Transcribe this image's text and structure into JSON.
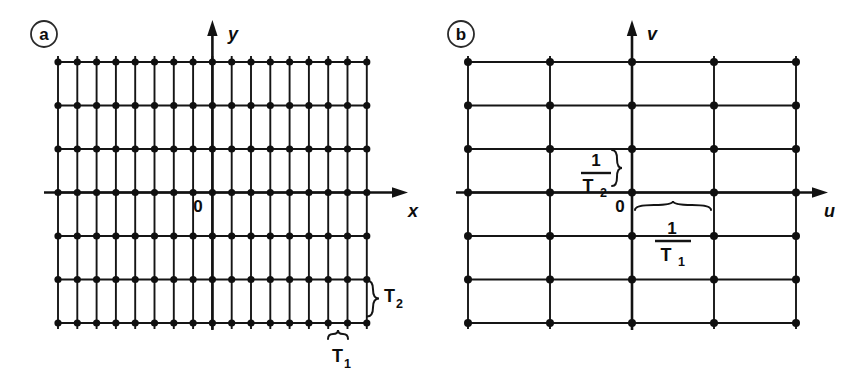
{
  "figure": {
    "background_color": "#ffffff",
    "ink_color": "#101010",
    "panels": [
      {
        "id": "a",
        "label": "a",
        "description": "direct-space sampling lattice",
        "axes": {
          "horizontal": "x",
          "vertical": "u_unused_v",
          "vertical_label": "y"
        },
        "origin_label": "0",
        "grid": {
          "columns": 17,
          "rows": 7,
          "x_start": 58,
          "x_step": 19.3,
          "y_start": 62,
          "y_step": 43.5,
          "origin_col_index": 8,
          "origin_row_index": 3
        },
        "spacing_labels": {
          "vertical": {
            "text": "T",
            "sub": "2"
          },
          "horizontal": {
            "text": "T",
            "sub": "1"
          }
        }
      },
      {
        "id": "b",
        "label": "b",
        "description": "reciprocal-space replication lattice",
        "axes": {
          "horizontal": "u",
          "vertical_label": "v"
        },
        "origin_label": "0",
        "grid": {
          "columns": 5,
          "rows": 7,
          "x_start": 468,
          "x_step": 82,
          "y_start": 62,
          "y_step": 43.5,
          "origin_col_index": 2,
          "origin_row_index": 3
        },
        "spacing_labels": {
          "vertical": {
            "numerator": "1",
            "denominator": "T",
            "denominator_sub": "2"
          },
          "horizontal": {
            "numerator": "1",
            "denominator": "T",
            "denominator_sub": "1"
          }
        }
      }
    ]
  }
}
